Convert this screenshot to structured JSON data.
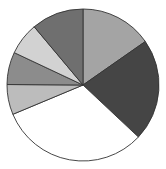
{
  "chart_data": {
    "type": "pie",
    "title": "",
    "legend": [],
    "start_angle_deg": 0,
    "direction": "clockwise",
    "slices": [
      {
        "label": "",
        "value": 15.3,
        "color": "#a4a4a4"
      },
      {
        "label": "",
        "value": 21.7,
        "color": "#454545"
      },
      {
        "label": "",
        "value": 31.7,
        "color": "#ffffff"
      },
      {
        "label": "",
        "value": 6.4,
        "color": "#bcbcbc"
      },
      {
        "label": "",
        "value": 6.9,
        "color": "#8c8c8c"
      },
      {
        "label": "",
        "value": 6.9,
        "color": "#d2d2d2"
      },
      {
        "label": "",
        "value": 11.1,
        "color": "#6f6f6f"
      }
    ],
    "geometry": {
      "cx": 83,
      "cy": 85,
      "r": 76
    }
  }
}
